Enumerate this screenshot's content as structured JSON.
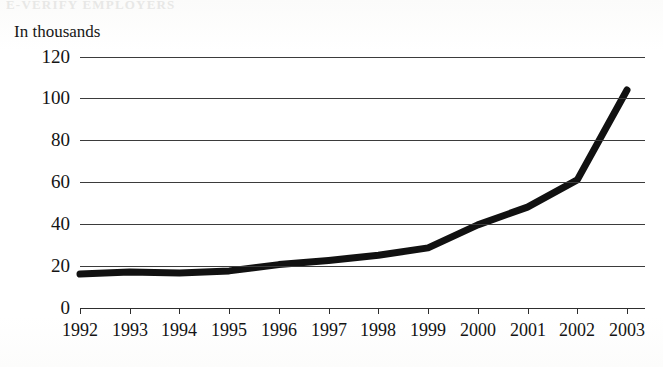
{
  "figure": {
    "cropped_title_remnant": "E-VERIFY EMPLOYERS",
    "unit_label": "In thousands"
  },
  "chart_data": {
    "type": "line",
    "title": "",
    "subtitle": "",
    "xlabel": "",
    "ylabel": "In thousands",
    "categories": [
      "1992",
      "1993",
      "1994",
      "1995",
      "1996",
      "1997",
      "1998",
      "1999",
      "2000",
      "2001",
      "2002",
      "2003"
    ],
    "values": [
      16,
      17,
      16.5,
      17.5,
      20.5,
      22.5,
      25,
      28.5,
      39.5,
      48,
      61,
      104
    ],
    "series": [
      {
        "name": "In thousands",
        "values": [
          16,
          17,
          16.5,
          17.5,
          20.5,
          22.5,
          25,
          28.5,
          39.5,
          48,
          61,
          104
        ]
      }
    ],
    "x": [
      "1992",
      "1993",
      "1994",
      "1995",
      "1996",
      "1997",
      "1998",
      "1999",
      "2000",
      "2001",
      "2002",
      "2003"
    ],
    "ylim": [
      0,
      120
    ],
    "yticks": [
      0,
      20,
      40,
      60,
      80,
      100,
      120
    ],
    "ytick_labels": [
      "0",
      "20",
      "40",
      "60",
      "80",
      "100",
      "120"
    ],
    "xtick_labels": [
      "1992",
      "1993",
      "1994",
      "1995",
      "1996",
      "1997",
      "1998",
      "1999",
      "2000",
      "2001",
      "2002",
      "2003"
    ],
    "grid": true,
    "grid_axis": "y",
    "legend": false,
    "legend_position": "none",
    "line_color": "#111111",
    "line_width": 7,
    "markers": false,
    "annotations": []
  },
  "colors": {
    "line": "#111111",
    "gridline": "#3b3b3b",
    "axis": "#2e2e2e",
    "text": "#141414",
    "background": "#fdfdfc"
  }
}
